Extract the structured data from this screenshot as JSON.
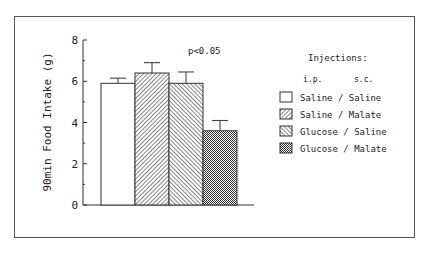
{
  "chart_data": {
    "type": "bar",
    "title": "",
    "xlabel": "",
    "ylabel": "90min Food Intake (g)",
    "ylim": [
      0,
      8
    ],
    "yticks": [
      0,
      2,
      4,
      6,
      8
    ],
    "grid": false,
    "legend_position": "right",
    "categories": [
      "Saline / Saline",
      "Saline / Malate",
      "Glucose / Saline",
      "Glucose / Malate"
    ],
    "values": [
      5.9,
      6.4,
      5.9,
      3.6
    ],
    "error_upper": [
      0.25,
      0.5,
      0.55,
      0.5
    ],
    "patterns": [
      "blank",
      "hatch-forward",
      "hatch-back",
      "crosshatch"
    ],
    "annotation": "p<0.05",
    "legend": {
      "title": "Injections:",
      "subheader_ip": "i.p.",
      "subheader_sc": "s.c.",
      "entries": [
        "Saline / Saline",
        "Saline / Malate",
        "Glucose / Saline",
        "Glucose / Malate"
      ]
    }
  }
}
